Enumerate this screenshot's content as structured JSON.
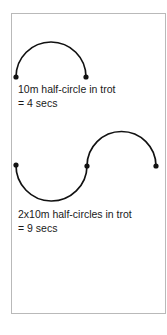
{
  "figure": {
    "background_color": "#ffffff",
    "frame": {
      "border_color": "#b9b9b9",
      "fill_color": "#ffffff"
    },
    "stroke_color": "#111111",
    "marker_color": "#111111"
  },
  "diagrams": [
    {
      "name": "single-half-circle",
      "shape": "half-circle",
      "bulge": "up",
      "start_point": [
        16,
        77
      ],
      "end_point": [
        86,
        77
      ],
      "apex_y": 39,
      "radius": 35,
      "markers": [
        [
          16,
          77
        ],
        [
          86,
          77
        ]
      ],
      "caption_line_1": "10m half-circle in trot",
      "caption_line_2": "= 4 secs"
    },
    {
      "name": "double-half-circle-serpentine",
      "shape": "s-curve",
      "start_point": [
        16,
        165
      ],
      "middle_point": [
        87,
        166
      ],
      "end_point": [
        156,
        166
      ],
      "left_arc_bulge": "down",
      "left_arc_extreme_y": 200,
      "right_arc_bulge": "up",
      "right_arc_extreme_y": 132,
      "radius": 35,
      "markers": [
        [
          16,
          165
        ],
        [
          87,
          166
        ],
        [
          156,
          166
        ]
      ],
      "caption_line_1": "2x10m half-circles in trot",
      "caption_line_2": "= 9 secs"
    }
  ]
}
